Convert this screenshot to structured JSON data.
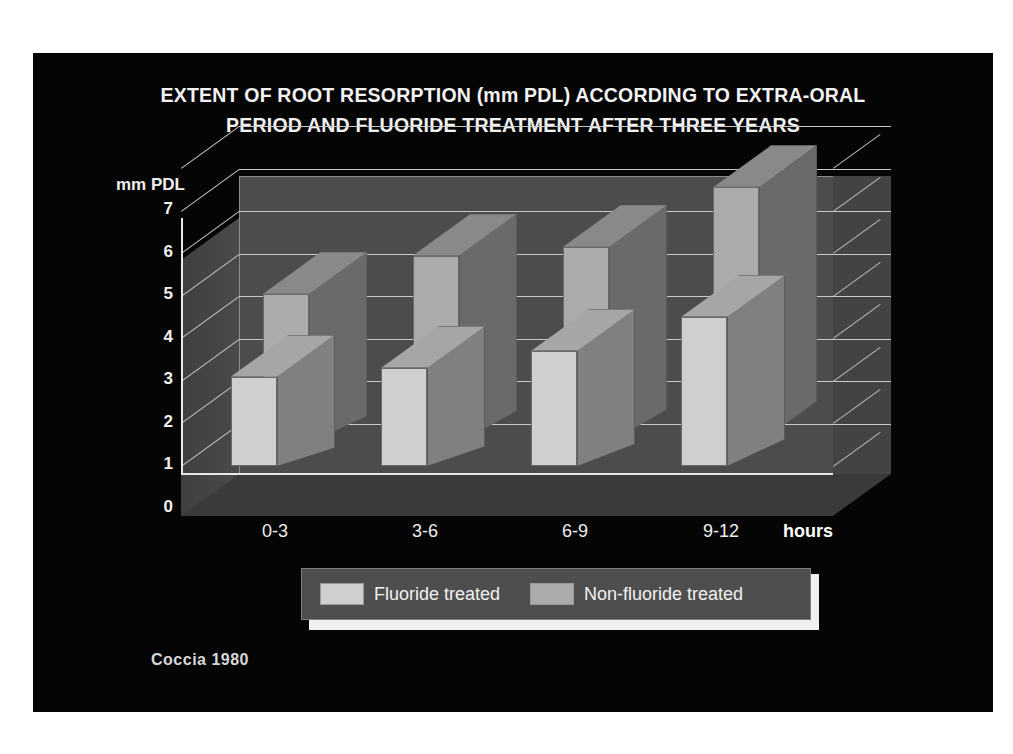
{
  "slide": {
    "background_color": "#050505",
    "page_background_color": "#ffffff",
    "citation": "Coccia 1980"
  },
  "title": {
    "line1": "EXTENT OF ROOT RESORPTION (mm PDL) ACCORDING TO EXTRA-ORAL",
    "line2": "PERIOD AND FLUORIDE TREATMENT AFTER THREE YEARS"
  },
  "axes": {
    "y_axis_title": "mm PDL",
    "y_ticks": [
      "7",
      "6",
      "5",
      "4",
      "3",
      "2",
      "1",
      "0"
    ],
    "x_unit_label": "hours"
  },
  "legend": {
    "items": [
      {
        "label": "Fluoride treated",
        "color": "#cfcfcf"
      },
      {
        "label": "Non-fluoride treated",
        "color": "#ababab"
      }
    ]
  },
  "chart_data": {
    "type": "bar",
    "title": "EXTENT OF ROOT RESORPTION (mm PDL) ACCORDING TO EXTRA-ORAL PERIOD AND FLUORIDE TREATMENT AFTER THREE YEARS",
    "xlabel": "hours",
    "ylabel": "mm PDL",
    "ylim": [
      0,
      7
    ],
    "ytick_step": 1,
    "grid": true,
    "legend_position": "bottom",
    "three_d": true,
    "categories": [
      "0-3",
      "3-6",
      "6-9",
      "9-12"
    ],
    "series": [
      {
        "name": "Fluoride treated",
        "color": "#cfcfcf",
        "values": [
          2.1,
          2.3,
          2.7,
          3.5
        ]
      },
      {
        "name": "Non-fluoride treated",
        "color": "#ababab",
        "values": [
          3.5,
          4.4,
          4.6,
          6.0
        ]
      }
    ],
    "source": "Coccia 1980"
  },
  "render": {
    "unit_px": 42.57,
    "baseline_y": 298,
    "bar_width": 46,
    "groups": [
      {
        "cat": "0-3",
        "front_x": 88,
        "label_x": 82
      },
      {
        "cat": "3-6",
        "front_x": 238,
        "label_x": 232
      },
      {
        "cat": "6-9",
        "front_x": 388,
        "label_x": 382
      },
      {
        "cat": "9-12",
        "front_x": 538,
        "label_x": 528
      }
    ]
  }
}
